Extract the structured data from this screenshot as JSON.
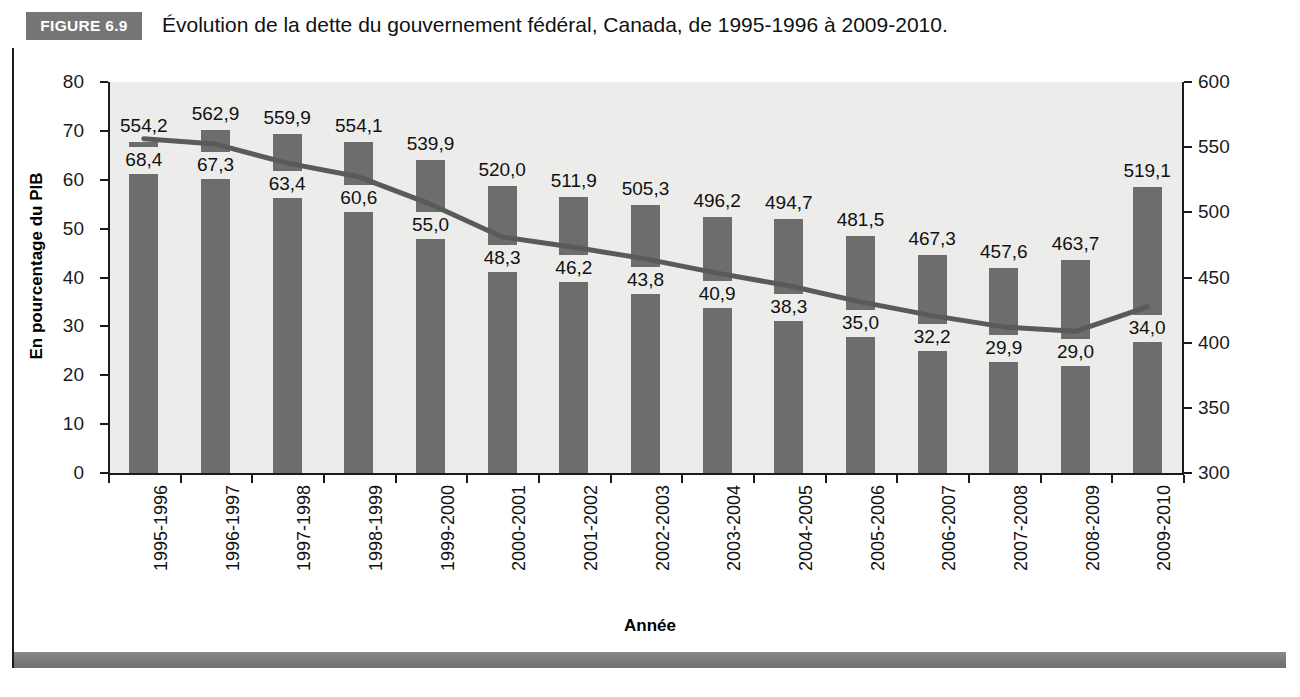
{
  "figure": {
    "tag": "FIGURE 6.9",
    "title": "Évolution de la dette du gouvernement fédéral, Canada, de 1995-1996 à 2009-2010."
  },
  "axes": {
    "left_label": "En pourcentage du PIB",
    "right_label": "En milliards de dollars",
    "x_label": "Année",
    "left_ticks": [
      "0",
      "10",
      "20",
      "30",
      "40",
      "50",
      "60",
      "70",
      "80"
    ],
    "right_ticks": [
      "300",
      "350",
      "400",
      "450",
      "500",
      "550",
      "600"
    ]
  },
  "colors": {
    "bar": "#6d6d6d",
    "line": "#5a5a5a",
    "plot_background": "#ececeb",
    "tag_background": "#767676",
    "band": "#7c7c7c"
  },
  "chart_data": {
    "type": "bar",
    "title": "Évolution de la dette du gouvernement fédéral, Canada, de 1995-1996 à 2009-2010.",
    "xlabel": "Année",
    "ylabel": "En pourcentage du PIB",
    "ylabel_secondary": "En milliards de dollars",
    "ylim": [
      0,
      80
    ],
    "ylim_secondary": [
      300,
      600
    ],
    "grid": false,
    "legend": "none",
    "categories": [
      "1995-1996",
      "1996-1997",
      "1997-1998",
      "1998-1999",
      "1999-2000",
      "2000-2001",
      "2001-2002",
      "2002-2003",
      "2003-2004",
      "2004-2005",
      "2005-2006",
      "2006-2007",
      "2007-2008",
      "2008-2009",
      "2009-2010"
    ],
    "series": [
      {
        "name": "Dette en milliards de dollars",
        "type": "bar",
        "axis": "right",
        "values": [
          554.2,
          562.9,
          559.9,
          554.1,
          539.9,
          520.0,
          511.9,
          505.3,
          496.2,
          494.7,
          481.5,
          467.3,
          457.6,
          463.7,
          519.1
        ],
        "labels": [
          "554,2",
          "562,9",
          "559,9",
          "554,1",
          "539,9",
          "520,0",
          "511,9",
          "505,3",
          "496,2",
          "494,7",
          "481,5",
          "467,3",
          "457,6",
          "463,7",
          "519,1"
        ]
      },
      {
        "name": "Dette en pourcentage du PIB",
        "type": "line",
        "axis": "left",
        "values": [
          68.4,
          67.3,
          63.4,
          60.6,
          55.0,
          48.3,
          46.2,
          43.8,
          40.9,
          38.3,
          35.0,
          32.2,
          29.9,
          29.0,
          34.0
        ],
        "labels": [
          "68,4",
          "67,3",
          "63,4",
          "60,6",
          "55,0",
          "48,3",
          "46,2",
          "43,8",
          "40,9",
          "38,3",
          "35,0",
          "32,2",
          "29,9",
          "29,0",
          "34,0"
        ]
      }
    ]
  }
}
